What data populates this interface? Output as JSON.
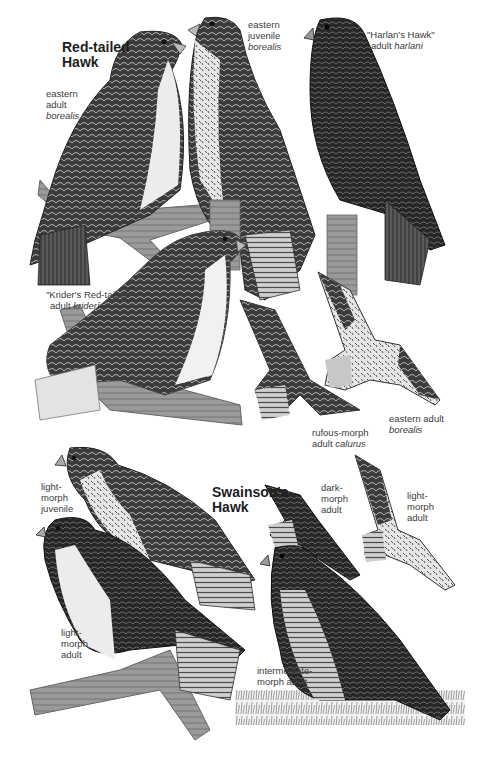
{
  "page": {
    "type": "field guide plate",
    "background": "#ffffff"
  },
  "species": [
    {
      "name_line1": "Red-tailed",
      "name_line2": "Hawk",
      "forms": [
        {
          "id": "eastern-adult-borealis",
          "line1": "eastern",
          "line2": "adult",
          "line3_italic": "borealis",
          "pose": "perched"
        },
        {
          "id": "eastern-juvenile-borealis",
          "line1": "eastern",
          "line2": "juvenile",
          "line3_italic": "borealis",
          "pose": "perched"
        },
        {
          "id": "harlans-hawk",
          "line1": "\"Harlan's Hawk\"",
          "line2_plain": "adult ",
          "line2_italic": "harlani",
          "pose": "perched"
        },
        {
          "id": "kriders-red-tailed",
          "line1": "\"Krider's Red-tailed\"",
          "line2_plain": "adult ",
          "line2_italic": "kriderí",
          "pose": "perched"
        },
        {
          "id": "rufous-morph-calurus",
          "line1": "rufous-morph",
          "line2_plain": "adult ",
          "line2_italic": "calurus",
          "pose": "flying"
        },
        {
          "id": "eastern-adult-borealis-flight",
          "line1": "eastern adult",
          "line2_italic": "borealis",
          "pose": "flying"
        }
      ]
    },
    {
      "name_line1": "Swainson's",
      "name_line2": "Hawk",
      "forms": [
        {
          "id": "light-morph-juvenile",
          "line1": "light-",
          "line2": "morph",
          "line3": "juvenile",
          "pose": "perched"
        },
        {
          "id": "light-morph-adult",
          "line1": "light-",
          "line2": "morph",
          "line3": "adult",
          "pose": "perched"
        },
        {
          "id": "dark-morph-adult",
          "line1": "dark-",
          "line2": "morph",
          "line3": "adult",
          "pose": "flying"
        },
        {
          "id": "light-morph-adult-flight",
          "line1": "light-",
          "line2": "morph",
          "line3": "adult",
          "pose": "flying"
        },
        {
          "id": "intermediate-morph-adult",
          "line1": "intermediate-",
          "line2": "morph adult",
          "pose": "perched"
        }
      ]
    }
  ],
  "colors": {
    "dark_plumage": "#2e2e2e",
    "mid_plumage": "#6a6a6a",
    "light_plumage": "#d8d8d8",
    "branch": "#8c8c8c",
    "label": "#3a3a3a",
    "title": "#1e1e1e"
  }
}
